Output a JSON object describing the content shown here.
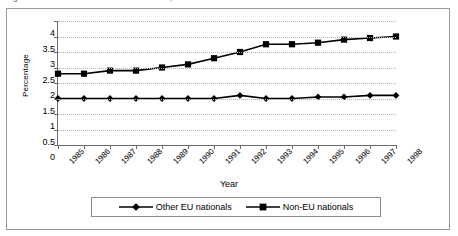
{
  "caption": {
    "text": "Figure 1.1   Share of non-nationals in the UK, 1985-1998"
  },
  "chart_data": {
    "type": "line",
    "title": "",
    "xlabel": "Year",
    "ylabel": "Percentage",
    "ylim": [
      0,
      4
    ],
    "ytick_labels": [
      "0",
      "0.5",
      "1",
      "1.5",
      "2",
      "2.5",
      "3",
      "3.5",
      "4"
    ],
    "ytick_values": [
      0,
      0.5,
      1,
      1.5,
      2,
      2.5,
      3,
      3.5,
      4
    ],
    "grid": "horizontal-dotted",
    "legend_position": "bottom",
    "categories": [
      "1985",
      "1986",
      "1987",
      "1988",
      "1989",
      "1990",
      "1991",
      "1992",
      "1993",
      "1994",
      "1995",
      "1996",
      "1997",
      "1998"
    ],
    "series": [
      {
        "name": "Other EU nationals",
        "marker": "diamond",
        "color": "#000000",
        "values": [
          1.5,
          1.5,
          1.5,
          1.5,
          1.5,
          1.5,
          1.5,
          1.6,
          1.5,
          1.5,
          1.55,
          1.55,
          1.6,
          1.6
        ]
      },
      {
        "name": "Non-EU nationals",
        "marker": "square",
        "color": "#000000",
        "values": [
          2.3,
          2.3,
          2.4,
          2.4,
          2.5,
          2.6,
          2.8,
          3.0,
          3.25,
          3.25,
          3.3,
          3.4,
          3.45,
          3.5
        ]
      }
    ]
  },
  "legend": {
    "items": [
      {
        "label": "Other EU nationals"
      },
      {
        "label": "Non-EU nationals"
      }
    ]
  }
}
